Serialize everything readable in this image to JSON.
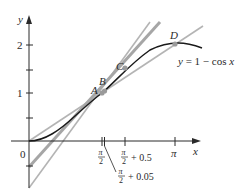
{
  "diagram": {
    "type": "function-graph",
    "function_label": "y = 1 − cos x",
    "axes": {
      "x_label": "x",
      "y_label": "y",
      "origin_label": "0",
      "y_ticks": [
        {
          "value": 2,
          "label": "2"
        },
        {
          "value": 1.5,
          "label": ""
        },
        {
          "value": 1,
          "label": "1"
        },
        {
          "value": 0.5,
          "label": ""
        },
        {
          "value": -0.5,
          "label": ""
        }
      ],
      "x_ticks": [
        {
          "value": 1.5708,
          "label": "π/2"
        },
        {
          "value": 1.6208,
          "label": "π/2 + 0.05"
        },
        {
          "value": 2.0708,
          "label": "π/2 + 0.5"
        },
        {
          "value": 3.1416,
          "label": "π"
        }
      ]
    },
    "points": [
      {
        "name": "A",
        "x": 1.5708,
        "y": 1.0
      },
      {
        "name": "B",
        "x": 1.6208,
        "y": 1.05
      },
      {
        "name": "C",
        "x": 2.0708,
        "y": 1.479
      },
      {
        "name": "D",
        "x": 3.1416,
        "y": 2.0
      }
    ],
    "lines": [
      {
        "name": "tangent-at-A",
        "color": "#b0b0b0"
      },
      {
        "name": "secant-AB",
        "color": "#9a9a9a"
      },
      {
        "name": "secant-AC",
        "color": "#9a9a9a"
      },
      {
        "name": "secant-AD",
        "color": "#b0b0b0"
      }
    ],
    "labels": {
      "point_a": "A",
      "point_b": "B",
      "point_c": "C",
      "point_d": "D",
      "y_tick_2": "2",
      "y_tick_1": "1",
      "origin": "0",
      "x_axis": "x",
      "y_axis": "y",
      "pi": "π",
      "two": "2",
      "plus_05": "+ 0.5",
      "plus_005": "+ 0.05",
      "curve_label_y": "y",
      "curve_label_rest": " = 1 − cos ",
      "curve_label_x": "x"
    },
    "colors": {
      "curve": "#1a1a1a",
      "axis": "#2a2a2a",
      "secant_gray": "#a8a8a8",
      "point_fill": "#9a9a9a"
    }
  }
}
